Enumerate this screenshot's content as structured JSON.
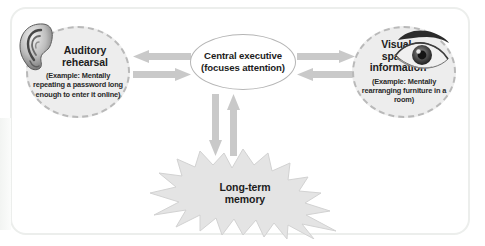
{
  "diagram": {
    "frame": {
      "border_color": "#eceeec",
      "background_color": "#ffffff"
    },
    "palette": {
      "circle_fill": "#ededed",
      "circle_border": "#b9b9b9",
      "ellipse_fill": "#ffffff",
      "ellipse_border": "#b5b5b5",
      "starburst_fill": "#e4e4e4",
      "starburst_border": "#cfcfcf",
      "arrow_color": "#c9c9c9",
      "text_color": "#1c1c1c"
    },
    "nodes": {
      "auditory": {
        "title_line1": "Auditory",
        "title_line2": "rehearsal",
        "example": "(Example: Mentally repeating a password long enough to enter it online)",
        "icon": "ear-illustration"
      },
      "central": {
        "title_line1": "Central executive",
        "title_line2": "(focuses attention)"
      },
      "visual": {
        "title_line1": "Visual-",
        "title_line2": "spatial",
        "title_line3": "information",
        "example": "(Example: Mentally rearranging furniture in a room)",
        "icon": "eye-illustration"
      },
      "longterm": {
        "title_line1": "Long-term",
        "title_line2": "memory"
      }
    },
    "connectors": [
      {
        "name": "auditory-from-central",
        "direction": "left",
        "side": "left"
      },
      {
        "name": "auditory-to-central",
        "direction": "right",
        "side": "left"
      },
      {
        "name": "central-to-visual",
        "direction": "right",
        "side": "right"
      },
      {
        "name": "visual-to-central",
        "direction": "left",
        "side": "right"
      },
      {
        "name": "central-to-longterm",
        "direction": "down",
        "side": "bottom"
      },
      {
        "name": "longterm-to-central",
        "direction": "up",
        "side": "bottom"
      }
    ]
  }
}
